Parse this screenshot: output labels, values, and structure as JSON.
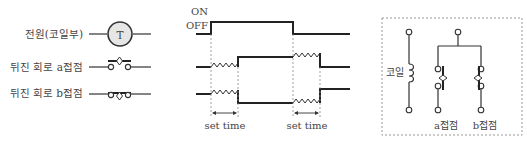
{
  "legend": {
    "items": [
      {
        "label": "전원(코일부)",
        "symbol": "T"
      },
      {
        "label": "뒤진 회로 a접점"
      },
      {
        "label": "뒤진 회로 b접점"
      }
    ]
  },
  "timing": {
    "on_label": "ON",
    "off_label": "OFF",
    "set_time_left": "set time",
    "set_time_right": "set time"
  },
  "circuit": {
    "coil_label": "코일",
    "a_contact_label": "a접점",
    "b_contact_label": "b접점"
  }
}
